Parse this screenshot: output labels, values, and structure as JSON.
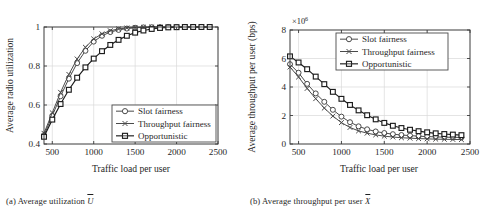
{
  "figure": {
    "panels": [
      {
        "id": "a",
        "caption_prefix": "(a)",
        "caption_text": "Average utilization",
        "caption_symbol": "U",
        "xlabel": "Traffic load per user",
        "ylabel": "Average radio utilization",
        "exponent_label": "",
        "xticks": [
          "500",
          "1000",
          "1500",
          "2000",
          "2500"
        ],
        "yticks": [
          "0.4",
          "0.6",
          "0.8",
          "1"
        ],
        "legend": [
          "Slot fairness",
          "Throughput fairness",
          "Opportunistic"
        ]
      },
      {
        "id": "b",
        "caption_prefix": "(b)",
        "caption_text": "Average throughput per user",
        "caption_symbol": "X",
        "xlabel": "Traffic load per user",
        "ylabel": "Average throughput per user (bps)",
        "exponent_label": "×10",
        "exponent_power": "6",
        "xticks": [
          "500",
          "1000",
          "1500",
          "2000",
          "2500"
        ],
        "yticks": [
          "0",
          "2",
          "4",
          "6",
          "8"
        ],
        "legend": [
          "Slot fairness",
          "Throughput fairness",
          "Opportunistic"
        ]
      }
    ]
  },
  "chart_data": [
    {
      "type": "line",
      "panel": "a",
      "title": "(a) Average utilization Ū",
      "xlabel": "Traffic load per user",
      "ylabel": "Average radio utilization",
      "xlim": [
        400,
        2500
      ],
      "ylim": [
        0.4,
        1.0
      ],
      "xticks": [
        500,
        1000,
        1500,
        2000,
        2500
      ],
      "yticks": [
        0.4,
        0.6,
        0.8,
        1.0
      ],
      "grid": true,
      "legend_position": "lower right",
      "x": [
        400,
        500,
        600,
        700,
        800,
        900,
        1000,
        1100,
        1200,
        1300,
        1400,
        1500,
        1600,
        1700,
        1800,
        1900,
        2000,
        2100,
        2200,
        2300,
        2400
      ],
      "series": [
        {
          "name": "Slot fairness",
          "marker": "circle",
          "values": [
            0.445,
            0.545,
            0.645,
            0.735,
            0.815,
            0.878,
            0.925,
            0.955,
            0.974,
            0.985,
            0.992,
            0.996,
            0.998,
            0.999,
            1.0,
            1.0,
            1.0,
            1.0,
            1.0,
            1.0,
            1.0
          ]
        },
        {
          "name": "Throughput fairness",
          "marker": "x",
          "values": [
            0.455,
            0.56,
            0.665,
            0.757,
            0.836,
            0.896,
            0.939,
            0.965,
            0.981,
            0.99,
            0.995,
            0.998,
            0.999,
            1.0,
            1.0,
            1.0,
            1.0,
            1.0,
            1.0,
            1.0,
            1.0
          ]
        },
        {
          "name": "Opportunistic",
          "marker": "square",
          "values": [
            0.437,
            0.525,
            0.605,
            0.678,
            0.74,
            0.793,
            0.838,
            0.876,
            0.908,
            0.934,
            0.955,
            0.971,
            0.982,
            0.99,
            0.995,
            0.998,
            0.999,
            1.0,
            1.0,
            1.0,
            1.0
          ]
        }
      ]
    },
    {
      "type": "line",
      "panel": "b",
      "title": "(b) Average throughput per user X̄",
      "xlabel": "Traffic load per user",
      "ylabel": "Average throughput per user (bps)",
      "y_multiplier": 1000000,
      "y_multiplier_label": "×10^6",
      "xlim": [
        400,
        2500
      ],
      "ylim": [
        0,
        8
      ],
      "xticks": [
        500,
        1000,
        1500,
        2000,
        2500
      ],
      "yticks": [
        0,
        2,
        4,
        6,
        8
      ],
      "grid": true,
      "legend_position": "upper right",
      "x": [
        400,
        500,
        600,
        700,
        800,
        900,
        1000,
        1100,
        1200,
        1300,
        1400,
        1500,
        1600,
        1700,
        1800,
        1900,
        2000,
        2100,
        2200,
        2300,
        2400
      ],
      "series": [
        {
          "name": "Slot fairness",
          "marker": "circle",
          "values": [
            5.6,
            5.0,
            4.22,
            3.55,
            2.96,
            2.4,
            1.92,
            1.53,
            1.24,
            1.03,
            0.88,
            0.77,
            0.69,
            0.63,
            0.59,
            0.55,
            0.52,
            0.5,
            0.48,
            0.47,
            0.46
          ]
        },
        {
          "name": "Throughput fairness",
          "marker": "x",
          "values": [
            5.4,
            4.7,
            3.9,
            3.18,
            2.52,
            1.96,
            1.5,
            1.16,
            0.92,
            0.76,
            0.64,
            0.55,
            0.49,
            0.44,
            0.41,
            0.38,
            0.36,
            0.34,
            0.33,
            0.32,
            0.31
          ]
        },
        {
          "name": "Opportunistic",
          "marker": "square",
          "values": [
            6.15,
            5.72,
            5.25,
            4.73,
            4.2,
            3.66,
            3.17,
            2.74,
            2.36,
            2.02,
            1.73,
            1.48,
            1.28,
            1.12,
            1.0,
            0.9,
            0.82,
            0.75,
            0.7,
            0.66,
            0.62
          ]
        }
      ]
    }
  ]
}
